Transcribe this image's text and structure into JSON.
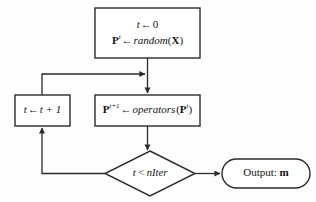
{
  "diagram": {
    "colors": {
      "background": "#fdfdfd",
      "stroke": "#2b2b2b",
      "node_fill": "#ffffff",
      "text": "#111111"
    },
    "nodes": {
      "init": {
        "shape": "rectangle",
        "line1_var": "t",
        "line1_arrow": "←",
        "line1_value": "0",
        "line2_var": "P",
        "line2_var_sup": "t",
        "line2_arrow": "←",
        "line2_func": "random",
        "line2_arg": "X",
        "text": "t ← 0 ; Pᵗ ← random(X)"
      },
      "increment": {
        "shape": "rectangle",
        "var": "t",
        "arrow": "←",
        "expr": "t + 1",
        "text": "t ← t + 1"
      },
      "operators": {
        "shape": "rectangle",
        "lhs_var": "P",
        "lhs_sup": "t+1",
        "arrow": "←",
        "func": "operators",
        "arg_var": "P",
        "arg_sup": "t",
        "text": "Pᵗ⁺¹ ← operators(Pᵗ)"
      },
      "condition": {
        "shape": "diamond",
        "lhs": "t",
        "operator": "<",
        "rhs": "nIter",
        "text": "t < nIter"
      },
      "output": {
        "shape": "rounded-rectangle",
        "label": "Output:",
        "value": "m",
        "text": "Output: m"
      }
    },
    "edges": [
      {
        "name": "init-to-operators",
        "from": "init",
        "to": "operators",
        "label": ""
      },
      {
        "name": "increment-to-operators",
        "from": "increment",
        "to": "operators",
        "label": ""
      },
      {
        "name": "operators-to-condition",
        "from": "operators",
        "to": "condition",
        "label": ""
      },
      {
        "name": "condition-to-increment",
        "from": "condition",
        "to": "increment",
        "label": ""
      },
      {
        "name": "condition-to-output",
        "from": "condition",
        "to": "output",
        "label": ""
      }
    ]
  }
}
